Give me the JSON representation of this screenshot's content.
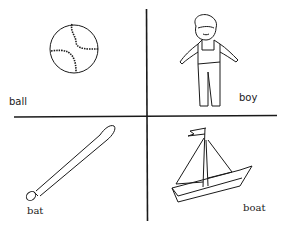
{
  "figure": {
    "layout": "2x2 grid of line drawings separated by a cross",
    "panels": [
      {
        "position": "top-left",
        "label": "ball",
        "depicts": "baseball with stitching"
      },
      {
        "position": "top-right",
        "label": "boy",
        "depicts": "boy wearing overalls"
      },
      {
        "position": "bottom-left",
        "label": "bat",
        "depicts": "baseball bat"
      },
      {
        "position": "bottom-right",
        "label": "boat",
        "depicts": "sailboat with flag"
      }
    ]
  },
  "colors": {
    "ink": "#1a1a1a",
    "background": "#ffffff"
  }
}
